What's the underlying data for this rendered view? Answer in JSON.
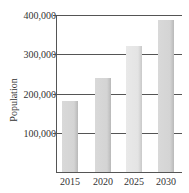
{
  "chart_data": {
    "type": "bar",
    "title": "",
    "xlabel": "",
    "ylabel": "Population",
    "categories": [
      "2015",
      "2020",
      "2025",
      "2030"
    ],
    "values": [
      180000,
      240000,
      320000,
      388000
    ],
    "ylim": [
      0,
      400000
    ],
    "yticks": [
      100000,
      200000,
      300000,
      400000
    ],
    "ytick_labels": [
      "100,000",
      "200,000",
      "300,000",
      "400,000"
    ],
    "grid": true,
    "legend": null,
    "colors": [
      "#d6d6d6",
      "#d6d6d6",
      "#e6e6e6",
      "#d6d6d6"
    ]
  }
}
